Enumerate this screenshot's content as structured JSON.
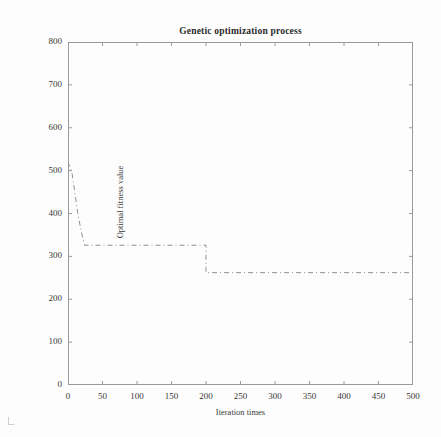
{
  "chart_data": {
    "type": "line",
    "title": "Genetic optimization process",
    "xlabel": "Iteration times",
    "ylabel": "Optimal fitness value",
    "xlim": [
      0,
      500
    ],
    "ylim": [
      0,
      800
    ],
    "xticks": [
      0,
      50,
      100,
      150,
      200,
      250,
      300,
      350,
      400,
      450,
      500
    ],
    "yticks": [
      0,
      100,
      200,
      300,
      400,
      500,
      600,
      700,
      800
    ],
    "grid": false,
    "legend": null,
    "line_style": "dash-dot",
    "line_color": "#8f8f8f",
    "series": [
      {
        "name": "Optimal fitness value",
        "x": [
          0,
          2,
          4,
          6,
          8,
          10,
          12,
          14,
          16,
          18,
          20,
          22,
          24,
          200,
          200,
          500
        ],
        "values": [
          520,
          512,
          505,
          492,
          470,
          448,
          425,
          402,
          385,
          368,
          352,
          340,
          326,
          326,
          262,
          262
        ]
      }
    ],
    "annotations": [
      "Initial fitness approximately 520 at iteration 0",
      "Rapid decline over first ~25 iterations to plateau of about 326",
      "Step down to final plateau of about 262 at iteration 200",
      "Converged value approximately 262 through iteration 500"
    ]
  },
  "figure": {
    "background_color": "#fdfdfd",
    "axis_color": "#9a9a9a",
    "text_color": "#3a3a3a"
  }
}
